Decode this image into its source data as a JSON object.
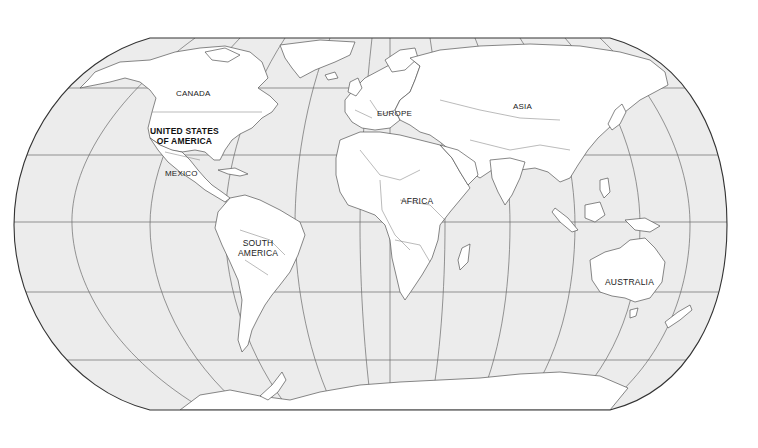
{
  "map": {
    "type": "world-outline-map",
    "projection": "Robinson",
    "colors": {
      "ocean": "#ececec",
      "land": "#ffffff",
      "border": "#555555",
      "graticule": "#666666",
      "frame": "#333333",
      "label": "#222222"
    },
    "labels": {
      "canada": "CANADA",
      "usa_line1": "UNITED STATES",
      "usa_line2": "OF AMERICA",
      "mexico": "MEXICO",
      "south_america_line1": "SOUTH",
      "south_america_line2": "AMERICA",
      "europe": "EUROPE",
      "asia": "ASIA",
      "africa": "AFRICA",
      "australia": "AUSTRALIA"
    }
  }
}
